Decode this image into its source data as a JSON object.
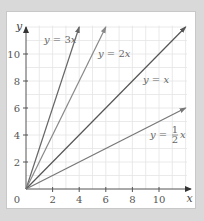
{
  "chart_data": {
    "type": "line",
    "title": "",
    "xlabel": "x",
    "ylabel": "y",
    "xlim": [
      0,
      12
    ],
    "ylim": [
      0,
      12
    ],
    "grid": true,
    "grid_step": 1,
    "origin_label": "0",
    "x_ticks": [
      2,
      4,
      6,
      8,
      10
    ],
    "y_ticks": [
      2,
      4,
      6,
      8,
      10
    ],
    "x_tick_labels": [
      "2",
      "4",
      "6",
      "8",
      "10"
    ],
    "y_tick_labels": [
      "2",
      "4",
      "6",
      "8",
      "10"
    ],
    "legend_position": "inline labels",
    "series": [
      {
        "name": "y = 3x",
        "slope": 3,
        "x": [
          0,
          4
        ],
        "y": [
          0,
          12
        ],
        "color": "#666666",
        "label_prefix": "y = 3",
        "label_var": "x"
      },
      {
        "name": "y = 2x",
        "slope": 2,
        "x": [
          0,
          6
        ],
        "y": [
          0,
          12
        ],
        "color": "#888888",
        "label_prefix": "y = 2",
        "label_var": "x"
      },
      {
        "name": "y = x",
        "slope": 1,
        "x": [
          0,
          12
        ],
        "y": [
          0,
          12
        ],
        "color": "#555555",
        "label_prefix": "y = ",
        "label_var": "x"
      },
      {
        "name": "y = 1/2 x",
        "slope": 0.5,
        "x": [
          0,
          12
        ],
        "y": [
          0,
          6
        ],
        "color": "#777777",
        "label_prefix": "y = ",
        "label_frac_num": "1",
        "label_frac_den": "2",
        "label_var": "x"
      }
    ]
  },
  "colors": {
    "background": "#d9d9d9",
    "panel": "#ffffff",
    "grid": "#e4e4e4",
    "axis": "#555555"
  }
}
